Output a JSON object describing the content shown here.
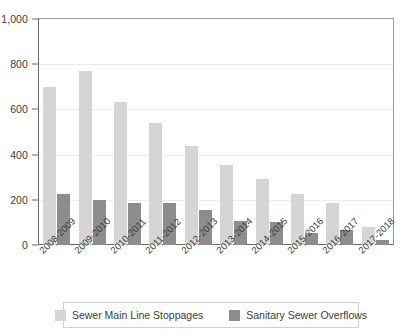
{
  "chart_data": {
    "type": "bar",
    "title": "",
    "subtitle": "",
    "xlabel": "",
    "ylabel": "",
    "ylim": [
      0,
      1000
    ],
    "yticks": [
      0,
      200,
      400,
      600,
      800,
      1000
    ],
    "ytick_labels": [
      "0",
      "200",
      "400",
      "600",
      "800",
      "1,000"
    ],
    "grid": true,
    "grid_axis": "y",
    "legend_position": "bottom",
    "orientation": "vertical",
    "categories": [
      "2008-2009",
      "2009-2010",
      "2010-2011",
      "2011-2012",
      "2012-2013",
      "2013-2014",
      "2014-2015",
      "2015-2016",
      "2016-2017",
      "2017-2018"
    ],
    "series": [
      {
        "name": "Sewer Main Line Stoppages",
        "color": "#d5d5d5",
        "values": [
          700,
          770,
          635,
          540,
          440,
          355,
          290,
          225,
          185,
          78
        ]
      },
      {
        "name": "Sanitary Sewer Overflows",
        "color": "#8d8d8d",
        "values": [
          225,
          200,
          188,
          187,
          155,
          105,
          100,
          52,
          68,
          20
        ]
      }
    ]
  },
  "legend": {
    "items": [
      {
        "label": "Sewer Main Line Stoppages",
        "color": "#d5d5d5"
      },
      {
        "label": "Sanitary Sewer Overflows",
        "color": "#8d8d8d"
      }
    ]
  }
}
